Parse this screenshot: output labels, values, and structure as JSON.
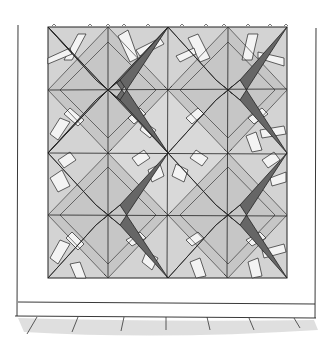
{
  "illustration": {
    "subject": "quilt hanging on wall",
    "colors": {
      "background": "#ffffff",
      "ink": "#222222",
      "star": "#6b6b6b",
      "star_dark": "#555555",
      "field": "#cfcfcf",
      "field_light": "#dcdcdc",
      "strip": "#f2f2f2",
      "floor": "#d6d6d6"
    },
    "quilt": {
      "x": 48,
      "y": 27,
      "width": 239,
      "height": 251,
      "grid_columns": 4,
      "grid_rows": 4,
      "stars": [
        {
          "cx": 108,
          "cy": 90
        },
        {
          "cx": 228,
          "cy": 90
        },
        {
          "cx": 108,
          "cy": 215
        },
        {
          "cx": 228,
          "cy": 215
        }
      ]
    },
    "wall": {
      "left_x": 18,
      "right_x": 316,
      "baseboard_top_y": 303,
      "baseboard_bottom_y": 316
    }
  }
}
